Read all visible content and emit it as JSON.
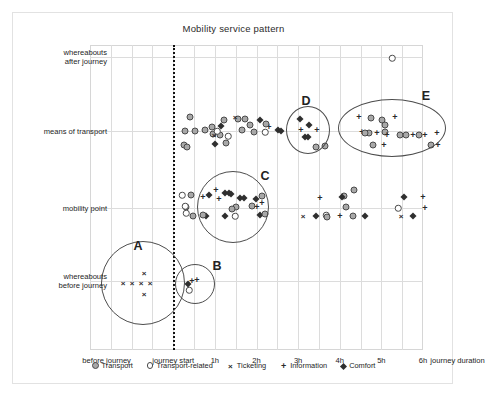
{
  "chart_data": {
    "type": "scatter",
    "title": "Mobility service pattern",
    "xlabel": "journey duration",
    "ylabel": "",
    "grid": true,
    "legend_position": "bottom",
    "x_ticks": [
      {
        "label": "before journey",
        "x": 0.8
      },
      {
        "label": "journey start",
        "x": 4.0
      },
      {
        "label": "1h",
        "x": 6.0
      },
      {
        "label": "2h",
        "x": 8.0
      },
      {
        "label": "3h",
        "x": 10.0
      },
      {
        "label": "4h",
        "x": 12.0
      },
      {
        "label": "5h",
        "x": 14.0
      },
      {
        "label": "6h",
        "x": 16.0
      }
    ],
    "y_categories": [
      {
        "label_line1": "whereabouts",
        "label_line2": "after journey",
        "y": 4
      },
      {
        "label_line1": "means of transport",
        "label_line2": "",
        "y": 3
      },
      {
        "label_line1": "mobility point",
        "label_line2": "",
        "y": 2
      },
      {
        "label_line1": "whereabouts",
        "label_line2": "before journey",
        "y": 1
      }
    ],
    "reference_line": {
      "label": "journey start",
      "x": 4.0,
      "style": "dotted"
    },
    "legend": [
      {
        "name": "Transport",
        "marker": "filled-circle",
        "color": "#a8a8a8"
      },
      {
        "name": "Transport-related",
        "marker": "open-circle",
        "color": "#ffffff"
      },
      {
        "name": "Ticketing",
        "marker": "cross-x",
        "color": "#2a2a2a"
      },
      {
        "name": "Information",
        "marker": "plus",
        "color": "#2a2a2a"
      },
      {
        "name": "Comfort",
        "marker": "filled-diamond",
        "color": "#2f2f2f"
      }
    ],
    "clusters": [
      {
        "id": "A",
        "shape": "circle",
        "cx": 130,
        "cy": 270,
        "rx": 42,
        "ry": 42,
        "label_x": 125,
        "label_y": 233
      },
      {
        "id": "B",
        "shape": "circle",
        "cx": 182,
        "cy": 271,
        "rx": 20,
        "ry": 20,
        "label_x": 204,
        "label_y": 253
      },
      {
        "id": "C",
        "shape": "circle",
        "cx": 220,
        "cy": 194,
        "rx": 36,
        "ry": 36,
        "label_x": 252,
        "label_y": 163
      },
      {
        "id": "D",
        "shape": "circle",
        "cx": 295,
        "cy": 117,
        "rx": 22,
        "ry": 24,
        "label_x": 293,
        "label_y": 88
      },
      {
        "id": "E",
        "shape": "ellipse",
        "cx": 379,
        "cy": 115,
        "rx": 54,
        "ry": 29,
        "label_x": 413,
        "label_y": 83
      }
    ],
    "points": [
      {
        "series": "Transport-related",
        "px": 379,
        "py": 45
      },
      {
        "series": "Transport",
        "px": 177,
        "py": 104
      },
      {
        "series": "Transport",
        "px": 172,
        "py": 118
      },
      {
        "series": "Transport",
        "px": 182,
        "py": 118
      },
      {
        "series": "Transport",
        "px": 192,
        "py": 117
      },
      {
        "series": "Transport",
        "px": 199,
        "py": 114
      },
      {
        "series": "Transport",
        "px": 200,
        "py": 121
      },
      {
        "series": "Transport",
        "px": 211,
        "py": 107
      },
      {
        "series": "Transport",
        "px": 207,
        "py": 122
      },
      {
        "series": "Transport",
        "px": 213,
        "py": 130
      },
      {
        "series": "Transport",
        "px": 225,
        "py": 106
      },
      {
        "series": "Transport",
        "px": 232,
        "py": 106
      },
      {
        "series": "Transport",
        "px": 237,
        "py": 112
      },
      {
        "series": "Transport",
        "px": 241,
        "py": 119
      },
      {
        "series": "Transport",
        "px": 229,
        "py": 117
      },
      {
        "series": "Transport",
        "px": 171,
        "py": 132
      },
      {
        "series": "Transport",
        "px": 174,
        "py": 134
      },
      {
        "series": "Transport-related",
        "px": 215,
        "py": 123
      },
      {
        "series": "Transport-related",
        "px": 204,
        "py": 118
      },
      {
        "series": "Ticketing",
        "px": 222,
        "py": 104
      },
      {
        "series": "Ticketing",
        "px": 201,
        "py": 122
      },
      {
        "series": "Comfort",
        "px": 208,
        "py": 113
      },
      {
        "series": "Comfort",
        "px": 202,
        "py": 131
      },
      {
        "series": "Comfort",
        "px": 247,
        "py": 107
      },
      {
        "series": "Comfort",
        "px": 265,
        "py": 117
      },
      {
        "series": "Comfort",
        "px": 268,
        "py": 118
      },
      {
        "series": "Information",
        "px": 256,
        "py": 114
      },
      {
        "series": "Transport",
        "px": 253,
        "py": 111
      },
      {
        "series": "Transport-related",
        "px": 252,
        "py": 119
      },
      {
        "series": "Comfort",
        "px": 287,
        "py": 106
      },
      {
        "series": "Comfort",
        "px": 296,
        "py": 112
      },
      {
        "series": "Comfort",
        "px": 292,
        "py": 124
      },
      {
        "series": "Comfort",
        "px": 295,
        "py": 124
      },
      {
        "series": "Information",
        "px": 288,
        "py": 117
      },
      {
        "series": "Information",
        "px": 304,
        "py": 117
      },
      {
        "series": "Transport",
        "px": 303,
        "py": 134
      },
      {
        "series": "Transport",
        "px": 312,
        "py": 133
      },
      {
        "series": "Information",
        "px": 346,
        "py": 104
      },
      {
        "series": "Information",
        "px": 382,
        "py": 104
      },
      {
        "series": "Transport",
        "px": 358,
        "py": 105
      },
      {
        "series": "Transport",
        "px": 369,
        "py": 107
      },
      {
        "series": "Transport",
        "px": 372,
        "py": 112
      },
      {
        "series": "Transport",
        "px": 372,
        "py": 119
      },
      {
        "series": "Transport",
        "px": 356,
        "py": 120
      },
      {
        "series": "Information",
        "px": 349,
        "py": 119
      },
      {
        "series": "Information",
        "px": 364,
        "py": 120
      },
      {
        "series": "Transport",
        "px": 352,
        "py": 120
      },
      {
        "series": "Information",
        "px": 374,
        "py": 122
      },
      {
        "series": "Transport",
        "px": 387,
        "py": 122
      },
      {
        "series": "Transport",
        "px": 393,
        "py": 122
      },
      {
        "series": "Information",
        "px": 400,
        "py": 122
      },
      {
        "series": "Transport",
        "px": 406,
        "py": 122
      },
      {
        "series": "Information",
        "px": 412,
        "py": 122
      },
      {
        "series": "Transport",
        "px": 360,
        "py": 132
      },
      {
        "series": "Information",
        "px": 371,
        "py": 132
      },
      {
        "series": "Transport",
        "px": 418,
        "py": 132
      },
      {
        "series": "Information",
        "px": 425,
        "py": 132
      },
      {
        "series": "Information",
        "px": 424,
        "py": 120
      },
      {
        "series": "Transport-related",
        "px": 169,
        "py": 182
      },
      {
        "series": "Transport",
        "px": 178,
        "py": 182
      },
      {
        "series": "Transport",
        "px": 173,
        "py": 194
      },
      {
        "series": "Transport-related",
        "px": 172,
        "py": 193
      },
      {
        "series": "Transport-related",
        "px": 173,
        "py": 200
      },
      {
        "series": "Transport",
        "px": 180,
        "py": 203
      },
      {
        "series": "Information",
        "px": 190,
        "py": 184
      },
      {
        "series": "Information",
        "px": 203,
        "py": 177
      },
      {
        "series": "Information",
        "px": 206,
        "py": 186
      },
      {
        "series": "Comfort",
        "px": 196,
        "py": 182
      },
      {
        "series": "Comfort",
        "px": 212,
        "py": 180
      },
      {
        "series": "Comfort",
        "px": 216,
        "py": 180
      },
      {
        "series": "Comfort",
        "px": 218,
        "py": 181
      },
      {
        "series": "Comfort",
        "px": 227,
        "py": 185
      },
      {
        "series": "Comfort",
        "px": 231,
        "py": 185
      },
      {
        "series": "Transport",
        "px": 223,
        "py": 194
      },
      {
        "series": "Transport",
        "px": 219,
        "py": 196
      },
      {
        "series": "Comfort",
        "px": 193,
        "py": 203
      },
      {
        "series": "Comfort",
        "px": 212,
        "py": 203
      },
      {
        "series": "Transport-related",
        "px": 222,
        "py": 203
      },
      {
        "series": "Transport",
        "px": 190,
        "py": 202
      },
      {
        "series": "Transport",
        "px": 239,
        "py": 193
      },
      {
        "series": "Transport",
        "px": 249,
        "py": 183
      },
      {
        "series": "Comfort",
        "px": 243,
        "py": 186
      },
      {
        "series": "Information",
        "px": 249,
        "py": 190
      },
      {
        "series": "Information",
        "px": 244,
        "py": 194
      },
      {
        "series": "Comfort",
        "px": 247,
        "py": 202
      },
      {
        "series": "Transport",
        "px": 252,
        "py": 201
      },
      {
        "series": "Ticketing",
        "px": 290,
        "py": 203
      },
      {
        "series": "Comfort",
        "px": 303,
        "py": 203
      },
      {
        "series": "Transport-related",
        "px": 313,
        "py": 202
      },
      {
        "series": "Transport",
        "px": 314,
        "py": 204
      },
      {
        "series": "Information",
        "px": 307,
        "py": 185
      },
      {
        "series": "Transport",
        "px": 331,
        "py": 183
      },
      {
        "series": "Comfort",
        "px": 329,
        "py": 184
      },
      {
        "series": "Transport",
        "px": 341,
        "py": 177
      },
      {
        "series": "Transport",
        "px": 333,
        "py": 194
      },
      {
        "series": "Information",
        "px": 327,
        "py": 203
      },
      {
        "series": "Transport",
        "px": 340,
        "py": 203
      },
      {
        "series": "Comfort",
        "px": 352,
        "py": 203
      },
      {
        "series": "Comfort",
        "px": 391,
        "py": 184
      },
      {
        "series": "Transport-related",
        "px": 385,
        "py": 195
      },
      {
        "series": "Ticketing",
        "px": 388,
        "py": 203
      },
      {
        "series": "Comfort",
        "px": 400,
        "py": 203
      },
      {
        "series": "Information",
        "px": 410,
        "py": 184
      },
      {
        "series": "Information",
        "px": 412,
        "py": 195
      },
      {
        "series": "Ticketing",
        "px": 110,
        "py": 270
      },
      {
        "series": "Ticketing",
        "px": 119,
        "py": 270
      },
      {
        "series": "Ticketing",
        "px": 128,
        "py": 270
      },
      {
        "series": "Ticketing",
        "px": 137,
        "py": 270
      },
      {
        "series": "Ticketing",
        "px": 131,
        "py": 260
      },
      {
        "series": "Ticketing",
        "px": 131,
        "py": 281
      },
      {
        "series": "Information",
        "px": 179,
        "py": 268
      },
      {
        "series": "Information",
        "px": 184,
        "py": 267
      },
      {
        "series": "Comfort",
        "px": 175,
        "py": 271
      },
      {
        "series": "Transport-related",
        "px": 176,
        "py": 277
      }
    ]
  }
}
